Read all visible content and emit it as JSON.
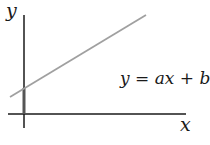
{
  "diagram": {
    "type": "linear-function-graph",
    "axis_labels": {
      "x": "x",
      "y": "y"
    },
    "equation": "y = ax + b",
    "colors": {
      "axis": "#1a1a1a",
      "line": "#a0a0a0",
      "intercept_highlight": "#555555"
    }
  }
}
